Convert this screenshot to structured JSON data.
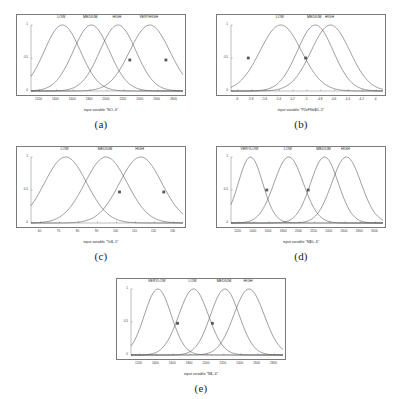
{
  "figure": {
    "background": "#ffffff",
    "curve_color": "#4d4d4d",
    "axis_color": "#7a7a7a",
    "marker_color": "#555555"
  },
  "panels": [
    {
      "letter": "(a)",
      "xlabel": "input variable \"NO--6\"",
      "yticks": [
        "0",
        "0.5",
        "1"
      ],
      "xticks": [
        "1200",
        "1400",
        "1600",
        "1800",
        "2000",
        "2200",
        "2400",
        "2600",
        "2800"
      ],
      "labels": [
        "LOW",
        "MEDIUM",
        "HIGH",
        "VERYHIGH"
      ]
    },
    {
      "letter": "(b)",
      "xlabel": "input variable \"P2oFNe$0--5\"",
      "yticks": [
        "0",
        "0.5",
        "1"
      ],
      "xticks": [
        "-6",
        "-5.8",
        "-5.6",
        "-5.4",
        "-5.2",
        "-5",
        "-4.8",
        "-4.6",
        "-4.4",
        "-4.2",
        "-4"
      ],
      "labels": [
        "LOW",
        "MEDIUM",
        "HIGH"
      ]
    },
    {
      "letter": "(c)",
      "xlabel": "input variable \"Te$--5\"",
      "yticks": [
        "0",
        "0.5",
        "1"
      ],
      "xticks": [
        "60",
        "70",
        "80",
        "90",
        "100",
        "110",
        "120",
        "130"
      ],
      "labels": [
        "LOW",
        "MEDIUM",
        "HIGH"
      ]
    },
    {
      "letter": "(d)",
      "xlabel": "input variable \"N$0--6\"",
      "yticks": [
        "0",
        "0.5",
        "1"
      ],
      "xticks": [
        "1200",
        "1400",
        "1600",
        "1800",
        "2000",
        "2200",
        "2400",
        "2600",
        "2800",
        "3000"
      ],
      "labels": [
        "VERYLOW",
        "LOW",
        "MEDIUM",
        "HIGH"
      ]
    },
    {
      "letter": "(e)",
      "xlabel": "input variable \"N$--6\"",
      "yticks": [
        "0",
        "0.5",
        "1"
      ],
      "xticks": [
        "1200",
        "1400",
        "1600",
        "1800",
        "2000",
        "2200",
        "2400",
        "2600",
        "2800"
      ],
      "labels": [
        "VERYLOW",
        "LOW",
        "MEDIUM",
        "HIGH"
      ]
    }
  ],
  "chart_data": [
    {
      "type": "line",
      "panel": "(a)",
      "title": "",
      "xlabel": "input variable \"NO--6\"",
      "ylabel": "",
      "xlim": [
        1200,
        2800
      ],
      "ylim": [
        0,
        1
      ],
      "grid": false,
      "legend_position": "inline-above-curves",
      "curve_shape": "gaussian membership functions",
      "series": [
        {
          "name": "LOW",
          "center": 1530,
          "sigma": 190,
          "peak": 1.0
        },
        {
          "name": "MEDIUM",
          "center": 1835,
          "sigma": 190,
          "peak": 1.0
        },
        {
          "name": "HIGH",
          "center": 2115,
          "sigma": 190,
          "peak": 1.0
        },
        {
          "name": "VERYHIGH",
          "center": 2450,
          "sigma": 210,
          "peak": 1.0
        }
      ],
      "markers": [
        {
          "x": 2240,
          "y": 0.47,
          "series": "HIGH"
        },
        {
          "x": 2620,
          "y": 0.47,
          "series": "VERYHIGH"
        }
      ]
    },
    {
      "type": "line",
      "panel": "(b)",
      "title": "",
      "xlabel": "input variable \"P2oFNe$0--5\"",
      "ylabel": "",
      "xlim": [
        -6.1,
        -3.9
      ],
      "ylim": [
        0,
        1
      ],
      "grid": false,
      "legend_position": "inline-above-curves",
      "curve_shape": "gaussian membership functions",
      "series": [
        {
          "name": "LOW",
          "center": -5.38,
          "sigma": 0.3,
          "peak": 1.0
        },
        {
          "name": "MEDIUM",
          "center": -4.88,
          "sigma": 0.26,
          "peak": 1.0
        },
        {
          "name": "HIGH",
          "center": -4.66,
          "sigma": 0.28,
          "peak": 1.0
        }
      ],
      "markers": [
        {
          "x": -5.85,
          "y": 0.5,
          "series": "LOW"
        },
        {
          "x": -5.02,
          "y": 0.5,
          "series": "MEDIUM"
        }
      ]
    },
    {
      "type": "line",
      "panel": "(c)",
      "title": "",
      "xlabel": "input variable \"Te$--5\"",
      "ylabel": "",
      "xlim": [
        58,
        137
      ],
      "ylim": [
        0,
        1
      ],
      "grid": false,
      "legend_position": "inline-above-curves",
      "curve_shape": "gaussian membership functions",
      "series": [
        {
          "name": "LOW",
          "center": 76,
          "sigma": 11,
          "peak": 1.0
        },
        {
          "name": "MEDIUM",
          "center": 97,
          "sigma": 11,
          "peak": 1.0
        },
        {
          "name": "HIGH",
          "center": 115,
          "sigma": 11,
          "peak": 1.0
        }
      ],
      "markers": [
        {
          "x": 104,
          "y": 0.47,
          "series": "MEDIUM"
        },
        {
          "x": 127,
          "y": 0.47,
          "series": "HIGH"
        }
      ]
    },
    {
      "type": "line",
      "panel": "(d)",
      "title": "",
      "xlabel": "input variable \"N$0--6\"",
      "ylabel": "",
      "xlim": [
        1180,
        3050
      ],
      "ylim": [
        0,
        1
      ],
      "grid": false,
      "legend_position": "inline-above-curves",
      "curve_shape": "gaussian membership functions",
      "series": [
        {
          "name": "VERYLOW",
          "center": 1420,
          "sigma": 150,
          "peak": 1.0
        },
        {
          "name": "LOW",
          "center": 1890,
          "sigma": 180,
          "peak": 1.0
        },
        {
          "name": "MEDIUM",
          "center": 2330,
          "sigma": 170,
          "peak": 1.0
        },
        {
          "name": "HIGH",
          "center": 2600,
          "sigma": 180,
          "peak": 1.0
        }
      ],
      "markers": [
        {
          "x": 1620,
          "y": 0.5,
          "series": "VERYLOW"
        },
        {
          "x": 2130,
          "y": 0.5,
          "series": "LOW"
        }
      ]
    },
    {
      "type": "line",
      "panel": "(e)",
      "title": "",
      "xlabel": "input variable \"N$--6\"",
      "ylabel": "",
      "xlim": [
        1180,
        2880
      ],
      "ylim": [
        0,
        1
      ],
      "grid": false,
      "legend_position": "inline-above-curves",
      "curve_shape": "gaussian membership functions",
      "series": [
        {
          "name": "VERYLOW",
          "center": 1480,
          "sigma": 150,
          "peak": 1.0
        },
        {
          "name": "LOW",
          "center": 1880,
          "sigma": 165,
          "peak": 1.0
        },
        {
          "name": "MEDIUM",
          "center": 2230,
          "sigma": 160,
          "peak": 1.0
        },
        {
          "name": "HIGH",
          "center": 2500,
          "sigma": 170,
          "peak": 1.0
        }
      ],
      "markers": [
        {
          "x": 1700,
          "y": 0.48,
          "series": "VERYLOW"
        },
        {
          "x": 2090,
          "y": 0.48,
          "series": "LOW"
        }
      ]
    }
  ]
}
